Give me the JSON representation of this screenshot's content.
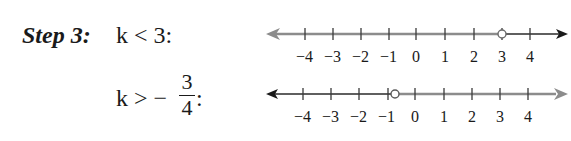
{
  "step": {
    "label": "Step 3:",
    "inequality1": {
      "text": "k < 3:",
      "variable": "k",
      "operator": "<",
      "value": "3"
    },
    "inequality2": {
      "prefix": "k > −",
      "numerator": "3",
      "denominator": "4",
      "suffix": ":",
      "variable": "k",
      "operator": ">",
      "value": "-3/4"
    }
  },
  "number_lines": [
    {
      "id": "line1",
      "tick_labels": [
        "−4",
        "−3",
        "−2",
        "−1",
        "0",
        "1",
        "2",
        "3",
        "4"
      ],
      "open_circle_at": 3,
      "shaded_direction": "left",
      "shaded_color": "#8c8c8c",
      "unshaded_color": "#2a2a2a"
    },
    {
      "id": "line2",
      "tick_labels": [
        "−4",
        "−3",
        "−2",
        "−1",
        "0",
        "1",
        "2",
        "3",
        "4"
      ],
      "open_circle_at": -0.75,
      "shaded_direction": "right",
      "shaded_color": "#8c8c8c",
      "unshaded_color": "#2a2a2a"
    }
  ]
}
